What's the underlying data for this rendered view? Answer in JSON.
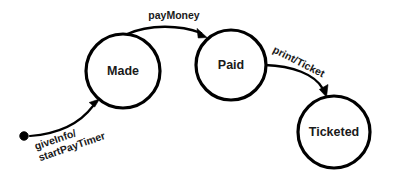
{
  "diagram": {
    "type": "state-machine",
    "canvas": {
      "width": 403,
      "height": 180,
      "background": "#ffffff"
    },
    "stroke_color": "#000000",
    "text_color": "#1a1a1a",
    "states": [
      {
        "id": "made",
        "label": "Made",
        "shape": "circle",
        "cx": 123,
        "cy": 71,
        "r": 37
      },
      {
        "id": "paid",
        "label": "Paid",
        "shape": "circle",
        "cx": 231,
        "cy": 65,
        "r": 35
      },
      {
        "id": "ticketed",
        "label": "Ticketed",
        "shape": "circle",
        "cx": 334,
        "cy": 132,
        "r": 36
      }
    ],
    "initial_marker": {
      "id": "start-dot",
      "cx": 24,
      "cy": 136,
      "r": 4.2
    },
    "transitions": [
      {
        "id": "start-to-made",
        "from": "start-dot",
        "to": "made",
        "label_lines": [
          "giveInfo/",
          "startPayTimer"
        ],
        "label_rotation_deg": -19,
        "label_x": 36,
        "label_y": 150
      },
      {
        "id": "made-to-paid",
        "from": "made",
        "to": "paid",
        "label_lines": [
          "payMoney"
        ],
        "label_rotation_deg": 0,
        "label_x": 174,
        "label_y": 19
      },
      {
        "id": "paid-to-ticketed",
        "from": "paid",
        "to": "ticketed",
        "label_lines": [
          "print/Ticket"
        ],
        "label_rotation_deg": 27,
        "label_x": 272,
        "label_y": 52
      }
    ]
  }
}
